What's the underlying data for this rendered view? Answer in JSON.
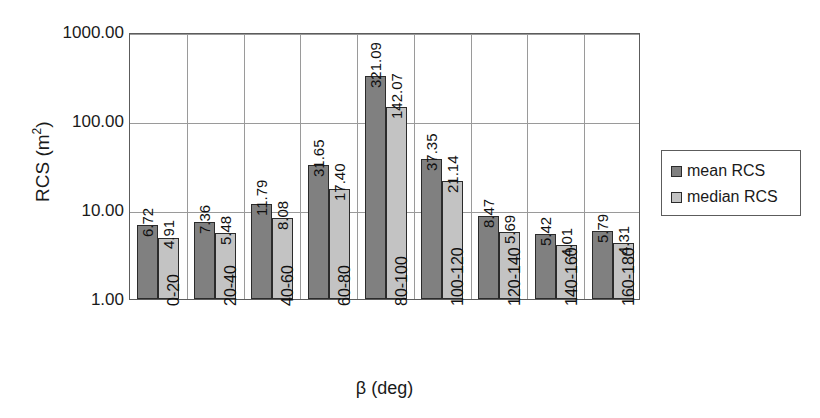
{
  "chart_data": {
    "type": "bar",
    "title": "",
    "xlabel": "β (deg)",
    "ylabel": "RCS (m²)",
    "ylabel_base": "RCS (m",
    "ylabel_sup": "2",
    "ylabel_close": ")",
    "yscale": "log",
    "ylim": [
      1,
      1000
    ],
    "ytick_labels": [
      "1000.00",
      "100.00",
      "10.00",
      "1.00"
    ],
    "ytick_values": [
      1000,
      100,
      10,
      1
    ],
    "grid": true,
    "legend_position": "right",
    "categories": [
      "0-20",
      "20-40",
      "40-60",
      "60-80",
      "80-100",
      "100-120",
      "120-140",
      "140-160",
      "160-180"
    ],
    "series": [
      {
        "name": "mean RCS",
        "color": "#808080",
        "values": [
          6.72,
          7.36,
          11.79,
          31.65,
          321.09,
          37.35,
          8.47,
          5.42,
          5.79
        ],
        "labels": [
          "6.72",
          "7.36",
          "11.79",
          "31.65",
          "321.09",
          "37.35",
          "8.47",
          "5.42",
          "5.79"
        ]
      },
      {
        "name": "median RCS",
        "color": "#c3c3c3",
        "values": [
          4.91,
          5.48,
          8.08,
          17.4,
          142.07,
          21.14,
          5.69,
          4.01,
          4.31
        ],
        "labels": [
          "4.91",
          "5.48",
          "8.08",
          "17.40",
          "142.07",
          "21.14",
          "5.69",
          "4.01",
          "4.31"
        ]
      }
    ]
  },
  "legend": {
    "items": [
      {
        "label": "mean RCS",
        "color": "#808080"
      },
      {
        "label": "median RCS",
        "color": "#c3c3c3"
      }
    ]
  }
}
